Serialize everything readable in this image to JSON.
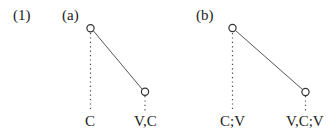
{
  "example_number": "(1)",
  "panels": [
    {
      "label": "(a)",
      "left_segment": "C",
      "right_segment": "V,C"
    },
    {
      "label": "(b)",
      "left_segment": "C;V",
      "right_segment": "V,C;V"
    }
  ],
  "colors": {
    "line": "#555555",
    "node": "#333333",
    "text": "#222222"
  }
}
